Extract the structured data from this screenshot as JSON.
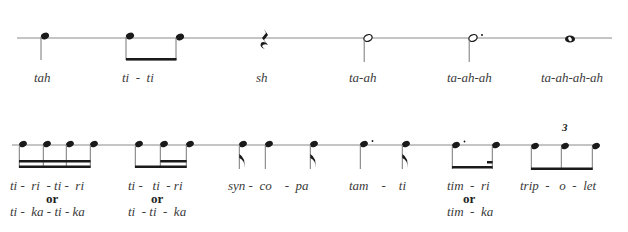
{
  "colors": {
    "ink": "#1a1a1a",
    "line": "#8a8a8a",
    "text": "#3a3a3a"
  },
  "row1": {
    "items": [
      {
        "symbol": "quarter-note",
        "label": "tah"
      },
      {
        "symbol": "two-eighth-notes",
        "label": "ti  -  ti"
      },
      {
        "symbol": "quarter-rest",
        "label": "sh"
      },
      {
        "symbol": "half-note",
        "label": "ta-ah"
      },
      {
        "symbol": "dotted-half-note",
        "label": "ta-ah-ah"
      },
      {
        "symbol": "whole-note",
        "label": "ta-ah-ah-ah"
      }
    ]
  },
  "row2": {
    "items": [
      {
        "symbol": "four-sixteenth-notes",
        "label": "ti -  ri  - ti -  ri",
        "or_label": "or",
        "alt_label": "ti -  ka - ti - ka"
      },
      {
        "symbol": "eighth-two-sixteenths",
        "label": "ti -   ti  - ri",
        "or_label": "or",
        "alt_label": "ti  - ti  -  ka"
      },
      {
        "symbol": "syncopation",
        "label": "syn -  co    -  pa"
      },
      {
        "symbol": "dotted-quarter-eighth",
        "label": "tam    -    ti"
      },
      {
        "symbol": "dotted-eighth-sixteenth",
        "label": "tim  -  ri",
        "or_label": "or",
        "alt_label": "tim  -  ka"
      },
      {
        "symbol": "eighth-note-triplet",
        "label": "trip  -   o  -  let",
        "tuplet_number": "3"
      }
    ]
  }
}
